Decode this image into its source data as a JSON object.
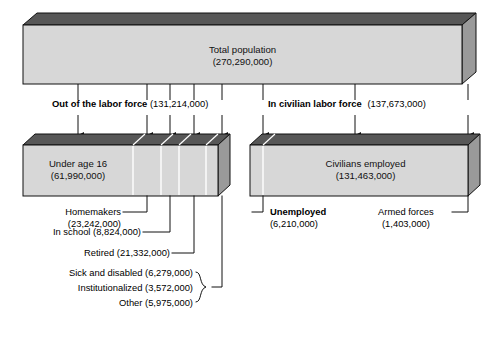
{
  "figure": {
    "type": "flow-breakdown-diagram",
    "title_hidden": "Composition of the U.S. population by labor force status"
  },
  "total": {
    "label": "Total population",
    "value": "(270,290,000)"
  },
  "branches": {
    "out_of_labor_force": {
      "label": "Out of the labor force",
      "value": "(131,214,000)"
    },
    "in_civilian_labor_force": {
      "label": "In civilian labor force",
      "value": "(137,673,000)"
    }
  },
  "left_bar": {
    "main": {
      "label": "Under age 16",
      "value": "(61,990,000)"
    },
    "segments": [
      {
        "name": "under-age-16",
        "label": "Under age 16",
        "value": "(61,990,000)"
      },
      {
        "name": "homemakers",
        "label": "Homemakers",
        "value": "(23,242,000)"
      },
      {
        "name": "in-school",
        "label": "In school",
        "value": "(8,824,000)"
      },
      {
        "name": "retired",
        "label": "Retired",
        "value": "(21,332,000)"
      },
      {
        "name": "sick-and-disabled",
        "label": "Sick and disabled",
        "value": "(6,279,000)"
      },
      {
        "name": "institutionalized",
        "label": "Institutionalized",
        "value": "(3,572,000)"
      },
      {
        "name": "other",
        "label": "Other",
        "value": "(5,975,000)"
      }
    ]
  },
  "right_bar": {
    "main": {
      "label": "Civilians employed",
      "value": "(131,463,000)"
    },
    "unemployed": {
      "label": "Unemployed",
      "value": "(6,210,000)"
    },
    "armed_forces": {
      "label": "Armed forces",
      "value": "(1,403,000)"
    }
  },
  "callouts": {
    "homemakers": "Homemakers",
    "homemakers_value": "(23,242,000)",
    "in_school": "In school (8,824,000)",
    "retired": "Retired (21,332,000)",
    "sick_and_disabled": "Sick and disabled (6,279,000)",
    "institutionalized": "Institutionalized (3,572,000)",
    "other": "Other (5,975,000)"
  },
  "colors": {
    "bar_front": "#d7d7d7",
    "bar_top": "#575757",
    "bar_side": "#9a9a9a",
    "outline": "#111111",
    "text": "#000000"
  }
}
